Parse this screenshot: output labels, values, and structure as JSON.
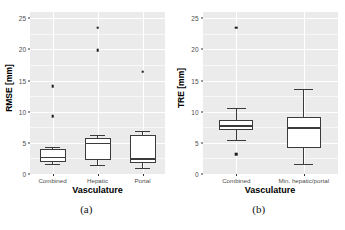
{
  "figure": {
    "panels": [
      {
        "caption": "(a)",
        "ylabel": "RMSE [mm]",
        "xlabel": "Vasculature"
      },
      {
        "caption": "(b)",
        "ylabel": "TRE [mm]",
        "xlabel": "Vasculature"
      }
    ]
  },
  "chart_data": [
    {
      "type": "box",
      "panel": "a",
      "title": "",
      "xlabel": "Vasculature",
      "ylabel": "RMSE [mm]",
      "ylim": [
        0,
        26
      ],
      "yticks": [
        0,
        5,
        10,
        15,
        20,
        25
      ],
      "ytick_labels": [
        "0",
        "5",
        "10",
        "15",
        "20",
        "25"
      ],
      "grid": true,
      "legend": "none",
      "categories": [
        "Combined",
        "Hepatic",
        "Portal"
      ],
      "boxes": [
        {
          "category": "Combined",
          "whisker_low": 1.6,
          "q1": 2.0,
          "median": 2.7,
          "q3": 4.0,
          "whisker_high": 4.3,
          "outliers": [
            9.3,
            14.1
          ]
        },
        {
          "category": "Hepatic",
          "whisker_low": 1.4,
          "q1": 2.3,
          "median": 4.9,
          "q3": 5.8,
          "whisker_high": 6.2,
          "outliers": [
            19.9,
            23.5
          ]
        },
        {
          "category": "Portal",
          "whisker_low": 1.0,
          "q1": 1.8,
          "median": 2.4,
          "q3": 6.2,
          "whisker_high": 6.9,
          "outliers": [
            16.4
          ]
        }
      ]
    },
    {
      "type": "box",
      "panel": "b",
      "title": "",
      "xlabel": "Vasculature",
      "ylabel": "TRE [mm]",
      "ylim": [
        0,
        26
      ],
      "yticks": [
        0,
        5,
        10,
        15,
        20,
        25
      ],
      "ytick_labels": [
        "0",
        "5",
        "10",
        "15",
        "20",
        "25"
      ],
      "grid": true,
      "legend": "none",
      "categories": [
        "Combined",
        "Min. hepatic/portal"
      ],
      "boxes": [
        {
          "category": "Combined",
          "whisker_low": 5.5,
          "q1": 7.0,
          "median": 7.7,
          "q3": 8.7,
          "whisker_high": 10.6,
          "outliers": [
            3.2,
            23.5
          ]
        },
        {
          "category": "Min. hepatic/portal",
          "whisker_low": 1.6,
          "q1": 4.2,
          "median": 7.4,
          "q3": 9.1,
          "whisker_high": 13.7,
          "outliers": []
        }
      ]
    }
  ],
  "colors": {
    "panel_background": "#ebebeb",
    "grid_major": "#ffffff",
    "grid_minor": "#f7f7f7",
    "box_fill": "#ffffff",
    "box_stroke": "#3b3b3b",
    "text": "#4d4d4d",
    "page_background": "#ffffff"
  }
}
